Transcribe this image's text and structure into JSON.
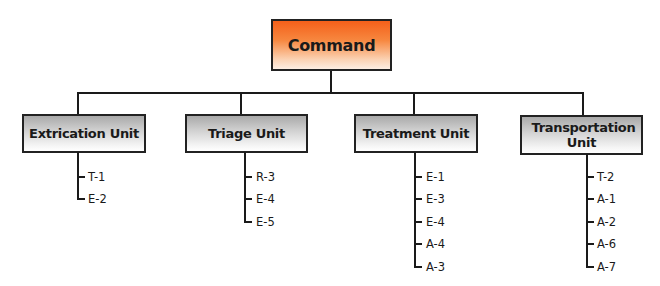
{
  "chart": {
    "root": {
      "label": "Command",
      "color": "#f4601a"
    },
    "units": [
      {
        "label": "Extrication Unit",
        "members": [
          "T-1",
          "E-2"
        ]
      },
      {
        "label": "Triage Unit",
        "members": [
          "R-3",
          "E-4",
          "E-5"
        ]
      },
      {
        "label": "Treatment Unit",
        "members": [
          "E-1",
          "E-3",
          "E-4",
          "A-4",
          "A-3"
        ]
      },
      {
        "label": "Transportation Unit",
        "members": [
          "T-2",
          "A-1",
          "A-2",
          "A-6",
          "A-7"
        ]
      }
    ]
  }
}
